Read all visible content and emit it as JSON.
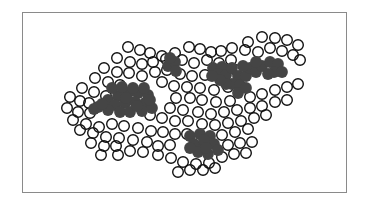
{
  "diagram": {
    "colors": {
      "outline": "#111111",
      "filled": "#454545",
      "frame": "#8a8a8a",
      "background": "#ffffff"
    },
    "open_circles": [
      [
        128,
        47
      ],
      [
        140,
        50
      ],
      [
        150,
        53
      ],
      [
        162,
        56
      ],
      [
        175,
        53
      ],
      [
        189,
        47
      ],
      [
        200,
        49
      ],
      [
        211,
        52
      ],
      [
        221,
        51
      ],
      [
        232,
        48
      ],
      [
        248,
        42
      ],
      [
        262,
        37
      ],
      [
        275,
        38
      ],
      [
        287,
        40
      ],
      [
        298,
        45
      ],
      [
        117,
        58
      ],
      [
        130,
        62
      ],
      [
        142,
        64
      ],
      [
        153,
        62
      ],
      [
        166,
        59
      ],
      [
        182,
        60
      ],
      [
        194,
        63
      ],
      [
        207,
        60
      ],
      [
        219,
        63
      ],
      [
        231,
        60
      ],
      [
        245,
        50
      ],
      [
        258,
        52
      ],
      [
        270,
        48
      ],
      [
        282,
        51
      ],
      [
        293,
        55
      ],
      [
        300,
        60
      ],
      [
        104,
        68
      ],
      [
        117,
        72
      ],
      [
        129,
        73
      ],
      [
        142,
        76
      ],
      [
        155,
        72
      ],
      [
        167,
        70
      ],
      [
        180,
        74
      ],
      [
        192,
        76
      ],
      [
        205,
        75
      ],
      [
        222,
        73
      ],
      [
        236,
        70
      ],
      [
        95,
        78
      ],
      [
        108,
        82
      ],
      [
        120,
        85
      ],
      [
        162,
        82
      ],
      [
        174,
        86
      ],
      [
        187,
        87
      ],
      [
        200,
        88
      ],
      [
        214,
        90
      ],
      [
        228,
        87
      ],
      [
        82,
        88
      ],
      [
        94,
        92
      ],
      [
        106,
        96
      ],
      [
        176,
        98
      ],
      [
        190,
        98
      ],
      [
        202,
        100
      ],
      [
        216,
        102
      ],
      [
        230,
        101
      ],
      [
        250,
        97
      ],
      [
        262,
        94
      ],
      [
        275,
        90
      ],
      [
        287,
        87
      ],
      [
        298,
        84
      ],
      [
        70,
        97
      ],
      [
        80,
        101
      ],
      [
        89,
        103
      ],
      [
        170,
        108
      ],
      [
        183,
        110
      ],
      [
        198,
        112
      ],
      [
        211,
        114
      ],
      [
        224,
        112
      ],
      [
        237,
        110
      ],
      [
        250,
        108
      ],
      [
        262,
        106
      ],
      [
        275,
        102
      ],
      [
        287,
        100
      ],
      [
        67,
        108
      ],
      [
        78,
        112
      ],
      [
        90,
        113
      ],
      [
        150,
        115
      ],
      [
        162,
        118
      ],
      [
        175,
        121
      ],
      [
        188,
        121
      ],
      [
        202,
        124
      ],
      [
        215,
        125
      ],
      [
        228,
        123
      ],
      [
        241,
        121
      ],
      [
        254,
        118
      ],
      [
        266,
        115
      ],
      [
        73,
        120
      ],
      [
        86,
        124
      ],
      [
        99,
        127
      ],
      [
        112,
        124
      ],
      [
        124,
        126
      ],
      [
        138,
        128
      ],
      [
        151,
        131
      ],
      [
        163,
        132
      ],
      [
        175,
        134
      ],
      [
        187,
        134
      ],
      [
        222,
        135
      ],
      [
        235,
        132
      ],
      [
        248,
        129
      ],
      [
        80,
        130
      ],
      [
        93,
        133
      ],
      [
        106,
        137
      ],
      [
        119,
        138
      ],
      [
        133,
        140
      ],
      [
        147,
        142
      ],
      [
        158,
        146
      ],
      [
        170,
        145
      ],
      [
        228,
        145
      ],
      [
        240,
        143
      ],
      [
        252,
        142
      ],
      [
        91,
        143
      ],
      [
        104,
        146
      ],
      [
        116,
        146
      ],
      [
        130,
        151
      ],
      [
        143,
        152
      ],
      [
        158,
        155
      ],
      [
        171,
        158
      ],
      [
        183,
        162
      ],
      [
        196,
        164
      ],
      [
        209,
        163
      ],
      [
        222,
        157
      ],
      [
        234,
        154
      ],
      [
        246,
        153
      ],
      [
        101,
        155
      ],
      [
        118,
        155
      ],
      [
        178,
        172
      ],
      [
        190,
        170
      ],
      [
        203,
        170
      ],
      [
        215,
        168
      ]
    ],
    "filled_clusters": [
      {
        "name": "cluster-left",
        "circles": [
          [
            108,
            100
          ],
          [
            118,
            96
          ],
          [
            128,
            93
          ],
          [
            138,
            93
          ],
          [
            148,
            95
          ],
          [
            115,
            105
          ],
          [
            125,
            103
          ],
          [
            135,
            102
          ],
          [
            145,
            103
          ],
          [
            98,
            107
          ],
          [
            108,
            110
          ],
          [
            120,
            112
          ],
          [
            130,
            112
          ],
          [
            142,
            111
          ],
          [
            152,
            108
          ],
          [
            112,
            88
          ],
          [
            122,
            87
          ],
          [
            133,
            88
          ],
          [
            144,
            88
          ],
          [
            126,
            98
          ],
          [
            137,
            106
          ],
          [
            150,
            100
          ],
          [
            94,
            109
          ],
          [
            102,
            104
          ]
        ]
      },
      {
        "name": "cluster-small",
        "circles": [
          [
            168,
            66
          ],
          [
            175,
            62
          ],
          [
            176,
            71
          ],
          [
            170,
            58
          ]
        ]
      },
      {
        "name": "cluster-right",
        "circles": [
          [
            213,
            68
          ],
          [
            222,
            67
          ],
          [
            218,
            74
          ],
          [
            226,
            75
          ],
          [
            232,
            68
          ],
          [
            238,
            76
          ],
          [
            232,
            84
          ],
          [
            240,
            85
          ],
          [
            246,
            76
          ],
          [
            250,
            68
          ],
          [
            243,
            66
          ],
          [
            256,
            72
          ],
          [
            262,
            66
          ],
          [
            270,
            62
          ],
          [
            278,
            64
          ],
          [
            274,
            72
          ],
          [
            282,
            72
          ],
          [
            268,
            74
          ],
          [
            226,
            84
          ],
          [
            238,
            93
          ],
          [
            246,
            88
          ],
          [
            220,
            80
          ],
          [
            212,
            76
          ],
          [
            256,
            62
          ]
        ]
      },
      {
        "name": "cluster-bottom",
        "circles": [
          [
            190,
            136
          ],
          [
            200,
            134
          ],
          [
            210,
            136
          ],
          [
            194,
            144
          ],
          [
            204,
            145
          ],
          [
            214,
            144
          ],
          [
            198,
            152
          ],
          [
            208,
            154
          ],
          [
            190,
            148
          ],
          [
            218,
            150
          ],
          [
            204,
            140
          ],
          [
            206,
            148
          ]
        ]
      }
    ]
  }
}
